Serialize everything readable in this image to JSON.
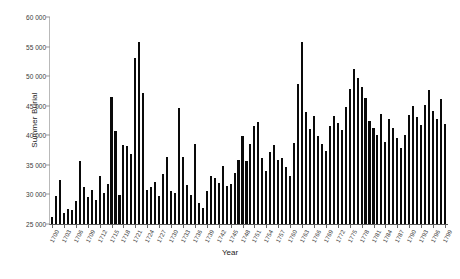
{
  "chart_data": {
    "type": "bar",
    "title": "",
    "xlabel": "Year",
    "ylabel": "Summer Burial",
    "ylim": [
      25000,
      60000
    ],
    "yticks": [
      "25 000",
      "30 000",
      "35 000",
      "40 000",
      "45 000",
      "50 000",
      "55 000",
      "60 000"
    ],
    "ytick_values": [
      25000,
      30000,
      35000,
      40000,
      45000,
      50000,
      55000,
      60000
    ],
    "grid": false,
    "legend": "none",
    "xtick_step": 3,
    "xtick_labels": [
      "1700",
      "1703",
      "1706",
      "1709",
      "1712",
      "1715",
      "1718",
      "1721",
      "1724",
      "1727",
      "1730",
      "1733",
      "1736",
      "1739",
      "1742",
      "1745",
      "1748",
      "1751",
      "1754",
      "1757",
      "1760",
      "1763",
      "1766",
      "1769",
      "1772",
      "1775",
      "1778",
      "1781",
      "1784",
      "1787",
      "1790",
      "1793",
      "1796",
      "1799"
    ],
    "categories": [
      1700,
      1701,
      1702,
      1703,
      1704,
      1705,
      1706,
      1707,
      1708,
      1709,
      1710,
      1711,
      1712,
      1713,
      1714,
      1715,
      1716,
      1717,
      1718,
      1719,
      1720,
      1721,
      1722,
      1723,
      1724,
      1725,
      1726,
      1727,
      1728,
      1729,
      1730,
      1731,
      1732,
      1733,
      1734,
      1735,
      1736,
      1737,
      1738,
      1739,
      1740,
      1741,
      1742,
      1743,
      1744,
      1745,
      1746,
      1747,
      1748,
      1749,
      1750,
      1751,
      1752,
      1753,
      1754,
      1755,
      1756,
      1757,
      1758,
      1759,
      1760,
      1761,
      1762,
      1763,
      1764,
      1765,
      1766,
      1767,
      1768,
      1769,
      1770,
      1771,
      1772,
      1773,
      1774,
      1775,
      1776,
      1777,
      1778,
      1779,
      1780,
      1781,
      1782,
      1783,
      1784,
      1785,
      1786,
      1787,
      1788,
      1789,
      1790,
      1791,
      1792,
      1793,
      1794,
      1795,
      1796,
      1797,
      1798,
      1799
    ],
    "values": [
      26200,
      29800,
      32400,
      26800,
      27600,
      27300,
      28900,
      35600,
      31200,
      29500,
      30700,
      29100,
      33100,
      30200,
      31800,
      46400,
      40700,
      29900,
      38400,
      38200,
      36900,
      53000,
      55800,
      47200,
      30700,
      31200,
      32100,
      29700,
      33500,
      36400,
      30500,
      30200,
      44600,
      36300,
      31600,
      29900,
      38600,
      28600,
      27700,
      30600,
      33200,
      32700,
      31900,
      34800,
      31500,
      31700,
      33600,
      35900,
      39800,
      35600,
      38500,
      41600,
      42300,
      36100,
      34000,
      37100,
      38400,
      35900,
      36200,
      34600,
      33200,
      38700,
      48600,
      55800,
      43900,
      41100,
      43200,
      39800,
      38600,
      37400,
      41500,
      43300,
      42100,
      40900,
      44800,
      47900,
      51200,
      49700,
      48100,
      46300,
      42400,
      41200,
      40100,
      43600,
      38900,
      42700,
      41300,
      39600,
      37800,
      40100,
      43500,
      44900,
      43100,
      41700,
      45200,
      47600,
      44100,
      42800,
      46100,
      41900
    ]
  },
  "axes": {
    "y_title": "Summer Burial",
    "x_title": "Year"
  },
  "caption": ""
}
